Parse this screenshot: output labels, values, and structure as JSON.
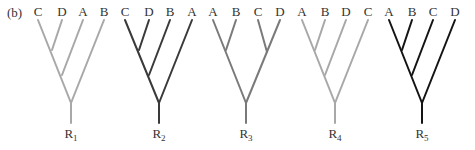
{
  "panel_label": "(b)",
  "colors": {
    "light": "#a8a8a8",
    "medium": "#7a7a7a",
    "dark": "#3a3a3a",
    "black": "#141414"
  },
  "trees": [
    {
      "root_label": "R",
      "root_sub": "1",
      "color": "#a8a8a8",
      "leaves": [
        {
          "label": "C",
          "x": 38
        },
        {
          "label": "D",
          "x": 62
        },
        {
          "label": "A",
          "x": 83
        },
        {
          "label": "B",
          "x": 104
        }
      ],
      "topology": "(((C,D),A),B)",
      "edges": [
        [
          38,
          20,
          71,
          103
        ],
        [
          62,
          20,
          52,
          50
        ],
        [
          83,
          20,
          62,
          75
        ],
        [
          104,
          20,
          71,
          103
        ],
        [
          71,
          103,
          71,
          123
        ]
      ]
    },
    {
      "root_label": "R",
      "root_sub": "2",
      "color": "#3a3a3a",
      "leaves": [
        {
          "label": "C",
          "x": 125
        },
        {
          "label": "D",
          "x": 149
        },
        {
          "label": "B",
          "x": 170
        },
        {
          "label": "A",
          "x": 192
        }
      ],
      "topology": "(((C,D),B),A)",
      "edges": [
        [
          125,
          20,
          159,
          103
        ],
        [
          149,
          20,
          139,
          50
        ],
        [
          170,
          20,
          149,
          75
        ],
        [
          192,
          20,
          159,
          103
        ],
        [
          159,
          103,
          159,
          123
        ]
      ]
    },
    {
      "root_label": "R",
      "root_sub": "3",
      "color": "#7a7a7a",
      "leaves": [
        {
          "label": "A",
          "x": 213
        },
        {
          "label": "B",
          "x": 236
        },
        {
          "label": "C",
          "x": 258
        },
        {
          "label": "D",
          "x": 280
        }
      ],
      "topology": "((A,B),(C,D))",
      "edges": [
        [
          213,
          20,
          246,
          103
        ],
        [
          236,
          20,
          226,
          50
        ],
        [
          258,
          20,
          267,
          52
        ],
        [
          280,
          20,
          246,
          103
        ],
        [
          246,
          103,
          246,
          123
        ]
      ]
    },
    {
      "root_label": "R",
      "root_sub": "4",
      "color": "#a8a8a8",
      "leaves": [
        {
          "label": "A",
          "x": 302
        },
        {
          "label": "B",
          "x": 325
        },
        {
          "label": "D",
          "x": 346
        },
        {
          "label": "C",
          "x": 368
        }
      ],
      "topology": "(((A,B),D),C)",
      "edges": [
        [
          302,
          20,
          335,
          103
        ],
        [
          325,
          20,
          315,
          50
        ],
        [
          346,
          20,
          325,
          75
        ],
        [
          368,
          20,
          335,
          103
        ],
        [
          335,
          103,
          335,
          123
        ]
      ]
    },
    {
      "root_label": "R",
      "root_sub": "5",
      "color": "#141414",
      "leaves": [
        {
          "label": "A",
          "x": 389
        },
        {
          "label": "B",
          "x": 412
        },
        {
          "label": "C",
          "x": 433
        },
        {
          "label": "D",
          "x": 455
        }
      ],
      "topology": "(((A,B),C),D)",
      "edges": [
        [
          389,
          20,
          422,
          103
        ],
        [
          412,
          20,
          402,
          50
        ],
        [
          433,
          20,
          412,
          75
        ],
        [
          455,
          20,
          422,
          103
        ],
        [
          422,
          103,
          422,
          123
        ]
      ]
    }
  ]
}
